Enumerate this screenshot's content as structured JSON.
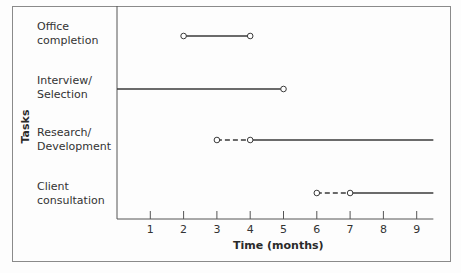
{
  "chart_data": {
    "type": "gantt",
    "title": "",
    "xlabel": "Time (months)",
    "ylabel": "Tasks",
    "xlim": [
      0,
      9.5
    ],
    "xticks": [
      1,
      2,
      3,
      4,
      5,
      6,
      7,
      8,
      9
    ],
    "grid": false,
    "legend": null,
    "tasks": [
      {
        "name": "Office completion",
        "label_lines": [
          "Office",
          "completion"
        ],
        "segments": [
          {
            "start": 2,
            "end": 4,
            "style": "solid",
            "start_marker": "open-circle",
            "end_marker": "open-circle"
          }
        ]
      },
      {
        "name": "Interview/Selection",
        "label_lines": [
          "Interview/",
          "Selection"
        ],
        "segments": [
          {
            "start": 0,
            "end": 5,
            "style": "solid",
            "start_marker": "none",
            "end_marker": "open-circle"
          }
        ]
      },
      {
        "name": "Research/Development",
        "label_lines": [
          "Research/",
          "Development"
        ],
        "segments": [
          {
            "start": 3,
            "end": 4,
            "style": "dashed",
            "start_marker": "open-circle",
            "end_marker": "open-circle"
          },
          {
            "start": 4,
            "end": 9.5,
            "style": "solid",
            "start_marker": "none",
            "end_marker": "none"
          }
        ]
      },
      {
        "name": "Client consultation",
        "label_lines": [
          "Client",
          "consultation"
        ],
        "segments": [
          {
            "start": 6,
            "end": 7,
            "style": "dashed",
            "start_marker": "open-circle",
            "end_marker": "open-circle"
          },
          {
            "start": 7,
            "end": 9.5,
            "style": "solid",
            "start_marker": "none",
            "end_marker": "none"
          }
        ]
      }
    ]
  },
  "colors": {
    "line": "#3a3a3a",
    "axis": "#555555",
    "frame": "#8a8a8a",
    "marker_fill": "#ffffff"
  }
}
